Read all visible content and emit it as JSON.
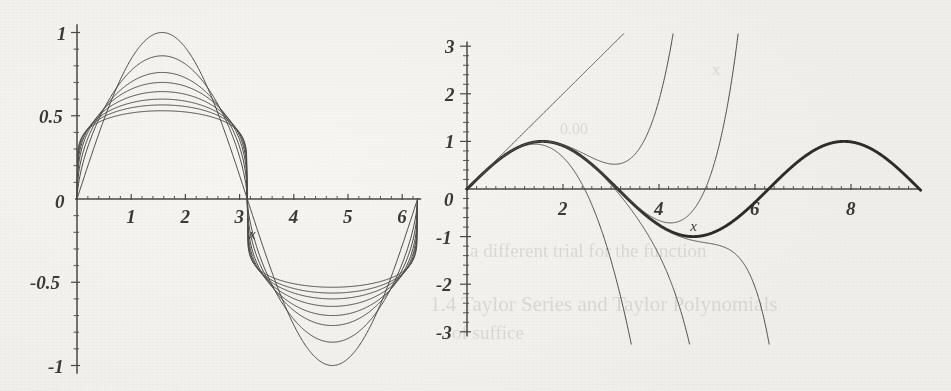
{
  "figure": {
    "kind": "scanned-textbook-figure",
    "background_color": "#f3f2ee",
    "ink_color": "#4a4845",
    "emphasis_color": "#2e2c29",
    "bleed_through": [
      {
        "text": "a different trial for the function",
        "x": 470,
        "y": 240,
        "size": 19
      },
      {
        "text": "1.4 Taylor Series and Taylor Polynomials",
        "x": 430,
        "y": 292,
        "size": 21
      },
      {
        "text": "of suffice",
        "x": 452,
        "y": 322,
        "size": 19
      },
      {
        "text": "0.00",
        "x": 560,
        "y": 120,
        "size": 16
      },
      {
        "text": "x",
        "x": 712,
        "y": 60,
        "size": 17
      }
    ]
  },
  "chart_data": [
    {
      "id": "left-plot",
      "type": "line",
      "title": "",
      "xlabel": "x",
      "ylabel": "",
      "xlim": [
        0,
        6.35
      ],
      "ylim": [
        -1.05,
        1.05
      ],
      "grid": false,
      "legend": "none",
      "x_ticks_major": [
        0,
        1,
        2,
        3,
        4,
        5,
        6
      ],
      "x_tick_labels": [
        "0",
        "1",
        "2",
        "3",
        "4",
        "5",
        "6"
      ],
      "x_minor_per_major": 5,
      "y_ticks_major": [
        -1,
        -0.5,
        0.5,
        1
      ],
      "y_tick_labels": [
        "-1",
        "-0.5",
        "0.5",
        "1"
      ],
      "y_minor_per_major": 5,
      "origin_label": "0",
      "description": "family of 8 sine-like curves of decreasing amplitude sharing zeros at 0, pi, 2pi",
      "series": [
        {
          "name": "amplitude 1.00",
          "model": "sin",
          "amplitude": 1.0,
          "flatness": 1.0
        },
        {
          "name": "amplitude 0.86",
          "model": "sin",
          "amplitude": 0.86,
          "flatness": 1.6
        },
        {
          "name": "amplitude 0.76",
          "model": "sin",
          "amplitude": 0.76,
          "flatness": 2.2
        },
        {
          "name": "amplitude 0.70",
          "model": "sin",
          "amplitude": 0.7,
          "flatness": 2.9
        },
        {
          "name": "amplitude 0.645",
          "model": "sin",
          "amplitude": 0.645,
          "flatness": 3.7
        },
        {
          "name": "amplitude 0.60",
          "model": "sin",
          "amplitude": 0.6,
          "flatness": 4.6
        },
        {
          "name": "amplitude 0.565",
          "model": "sin",
          "amplitude": 0.565,
          "flatness": 5.6
        },
        {
          "name": "amplitude 0.53",
          "model": "sin",
          "amplitude": 0.53,
          "flatness": 6.8
        }
      ]
    },
    {
      "id": "right-plot",
      "type": "line",
      "title": "",
      "xlabel": "x",
      "ylabel": "",
      "xlim": [
        0,
        9.45
      ],
      "ylim": [
        -3.1,
        3.1
      ],
      "grid": false,
      "legend": "none",
      "x_ticks_major": [
        2,
        4,
        6,
        8
      ],
      "x_tick_labels": [
        "2",
        "4",
        "6",
        "8"
      ],
      "x_minor_per_major": 5,
      "y_ticks_major": [
        -3,
        -2,
        -1,
        1,
        2,
        3
      ],
      "y_tick_labels": [
        "-3",
        "-2",
        "-1",
        "1",
        "2",
        "3"
      ],
      "y_minor_per_major": 5,
      "origin_label": "0",
      "description": "sin(x) drawn thick together with its Taylor polynomials about 0 of degrees 1,3,5,7,9,11",
      "series": [
        {
          "name": "sin(x)",
          "emphasis": true,
          "degree": null
        },
        {
          "name": "Taylor degree 1",
          "degree": 1
        },
        {
          "name": "Taylor degree 3",
          "degree": 3
        },
        {
          "name": "Taylor degree 5",
          "degree": 5
        },
        {
          "name": "Taylor degree 7",
          "degree": 7
        },
        {
          "name": "Taylor degree 9",
          "degree": 9
        },
        {
          "name": "Taylor degree 11",
          "degree": 11
        }
      ]
    }
  ]
}
